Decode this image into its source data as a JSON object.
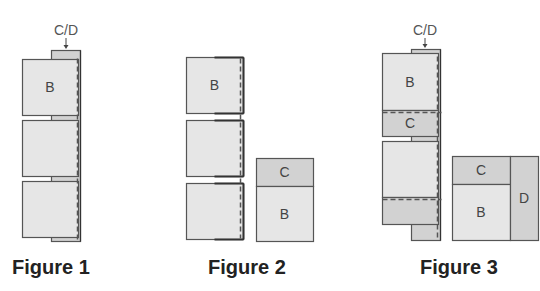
{
  "colors": {
    "light": "#e6e6e6",
    "dark": "#d2d2d2",
    "stroke": "#555555",
    "text": "#444444"
  },
  "figures": [
    {
      "caption": "Figure 1",
      "caption_x": 12,
      "annotation": {
        "text": "C/D",
        "x": 66,
        "y": 35,
        "arrow_x": 66,
        "arrow_y1": 38,
        "arrow_y2": 49
      },
      "rects": [
        {
          "x": 51,
          "y": 50,
          "w": 29,
          "h": 191,
          "fill": "dark"
        },
        {
          "x": 22,
          "y": 59,
          "w": 56,
          "h": 56,
          "fill": "light",
          "label": "B"
        },
        {
          "x": 22,
          "y": 120,
          "w": 56,
          "h": 56,
          "fill": "light"
        },
        {
          "x": 22,
          "y": 181,
          "w": 56,
          "h": 56,
          "fill": "light"
        }
      ],
      "dashed": [
        {
          "x1": 77,
          "y1": 58,
          "x2": 77,
          "y2": 240
        }
      ],
      "solid": [
        {
          "x1": 80,
          "y1": 50,
          "x2": 80,
          "y2": 241
        }
      ]
    },
    {
      "caption": "Figure 2",
      "caption_x": 208,
      "rects": [
        {
          "x": 186,
          "y": 57,
          "w": 57,
          "h": 56,
          "fill": "light",
          "label": "B"
        },
        {
          "x": 186,
          "y": 120,
          "w": 57,
          "h": 56,
          "fill": "light"
        },
        {
          "x": 186,
          "y": 183,
          "w": 57,
          "h": 56,
          "fill": "light"
        },
        {
          "x": 256,
          "y": 158,
          "w": 57,
          "h": 28,
          "fill": "dark",
          "label": "C"
        },
        {
          "x": 256,
          "y": 186,
          "w": 57,
          "h": 55,
          "fill": "light",
          "label": "B"
        }
      ],
      "dashed": [
        {
          "x1": 240,
          "y1": 58,
          "x2": 240,
          "y2": 238
        }
      ],
      "solid": [
        {
          "x1": 243,
          "y1": 57,
          "x2": 243,
          "y2": 113,
          "w": 2
        },
        {
          "x1": 243,
          "y1": 120,
          "x2": 243,
          "y2": 176,
          "w": 2
        },
        {
          "x1": 243,
          "y1": 183,
          "x2": 243,
          "y2": 239,
          "w": 2
        },
        {
          "x1": 214,
          "y1": 57,
          "x2": 243,
          "y2": 57,
          "w": 2
        },
        {
          "x1": 214,
          "y1": 113,
          "x2": 243,
          "y2": 113,
          "w": 2
        },
        {
          "x1": 214,
          "y1": 120,
          "x2": 243,
          "y2": 120,
          "w": 2
        },
        {
          "x1": 214,
          "y1": 176,
          "x2": 243,
          "y2": 176,
          "w": 2
        },
        {
          "x1": 214,
          "y1": 183,
          "x2": 243,
          "y2": 183,
          "w": 2
        },
        {
          "x1": 214,
          "y1": 239,
          "x2": 243,
          "y2": 239,
          "w": 2
        }
      ]
    },
    {
      "caption": "Figure 3",
      "caption_x": 420,
      "annotation": {
        "text": "C/D",
        "x": 425,
        "y": 35,
        "arrow_x": 425,
        "arrow_y1": 38,
        "arrow_y2": 48
      },
      "rects": [
        {
          "x": 411,
          "y": 49,
          "w": 29,
          "h": 191,
          "fill": "dark"
        },
        {
          "x": 382,
          "y": 53,
          "w": 56,
          "h": 57,
          "fill": "light",
          "label": "B"
        },
        {
          "x": 382,
          "y": 110,
          "w": 56,
          "h": 26,
          "fill": "dark",
          "label": "C"
        },
        {
          "x": 382,
          "y": 141,
          "w": 56,
          "h": 56,
          "fill": "light"
        },
        {
          "x": 382,
          "y": 197,
          "w": 56,
          "h": 27,
          "fill": "dark"
        },
        {
          "x": 452,
          "y": 156,
          "w": 58,
          "h": 28,
          "fill": "dark",
          "label": "C"
        },
        {
          "x": 452,
          "y": 184,
          "w": 58,
          "h": 56,
          "fill": "light",
          "label": "B"
        },
        {
          "x": 510,
          "y": 156,
          "w": 28,
          "h": 84,
          "fill": "dark",
          "label": "D"
        }
      ],
      "dashed": [
        {
          "x1": 437,
          "y1": 56,
          "x2": 437,
          "y2": 238
        },
        {
          "x1": 382,
          "y1": 112,
          "x2": 441,
          "y2": 112
        },
        {
          "x1": 382,
          "y1": 199,
          "x2": 441,
          "y2": 199
        }
      ],
      "solid": [
        {
          "x1": 440,
          "y1": 49,
          "x2": 440,
          "y2": 240
        }
      ]
    }
  ]
}
